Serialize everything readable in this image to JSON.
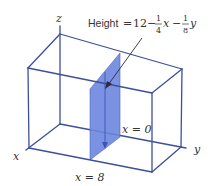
{
  "figure": {
    "axes": {
      "x": "x",
      "y": "y",
      "z": "z"
    },
    "height_label": {
      "prefix": "Height",
      "equals": "=",
      "constant": "12",
      "minus1": "−",
      "frac1": {
        "num": "1",
        "den": "4"
      },
      "var1": "x",
      "minus2": "−",
      "frac2": {
        "num": "1",
        "den": "8"
      },
      "var2": "y"
    },
    "plane_labels": {
      "x0": "x = 0",
      "x8": "x = 8"
    },
    "colors": {
      "edge": "#3d4f9c",
      "slab": "#6b86de"
    }
  }
}
